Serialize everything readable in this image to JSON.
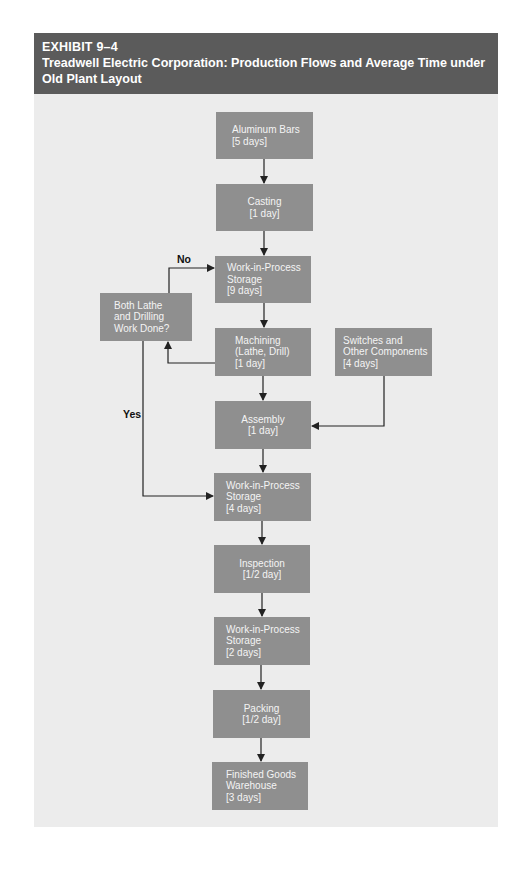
{
  "header": {
    "exhibit": "EXHIBIT 9–4",
    "title": "Treadwell Electric Corporation: Production Flows and Average Time under Old Plant Layout"
  },
  "colors": {
    "header_bg": "#5b5b5b",
    "panel_bg": "#ececec",
    "box_fill": "#8f8f8f",
    "box_text": "#f4f4f4",
    "line": "#222222"
  },
  "nodes": {
    "aluminum": {
      "line1": "Aluminum Bars",
      "line2": "[5 days]"
    },
    "casting": {
      "line1": "Casting",
      "line2": "[1 day]"
    },
    "wip1": {
      "line1": "Work-in-Process",
      "line2": "Storage",
      "line3": "[9 days]"
    },
    "decision": {
      "line1": "Both Lathe",
      "line2": "and Drilling",
      "line3": "Work Done?"
    },
    "machining": {
      "line1": "Machining",
      "line2": "(Lathe, Drill)",
      "line3": "[1 day]"
    },
    "switches": {
      "line1": "Switches and",
      "line2": "Other Components",
      "line3": "[4 days]"
    },
    "assembly": {
      "line1": "Assembly",
      "line2": "[1 day]"
    },
    "wip2": {
      "line1": "Work-in-Process",
      "line2": "Storage",
      "line3": "[4 days]"
    },
    "inspection": {
      "line1": "Inspection",
      "line2": "[1/2 day]"
    },
    "wip3": {
      "line1": "Work-in-Process",
      "line2": "Storage",
      "line3": "[2 days]"
    },
    "packing": {
      "line1": "Packing",
      "line2": "[1/2 day]"
    },
    "warehouse": {
      "line1": "Finished Goods",
      "line2": "Warehouse",
      "line3": "[3 days]"
    }
  },
  "edge_labels": {
    "no": "No",
    "yes": "Yes"
  }
}
